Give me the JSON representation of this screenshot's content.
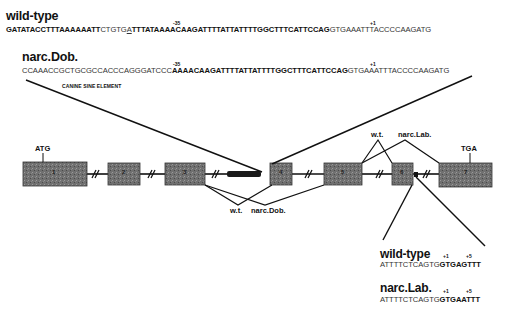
{
  "top": {
    "wildtype": {
      "title": "wild-type",
      "marker_minus": "-35",
      "marker_plus": "+1",
      "seq_parts": [
        "GATATACCTTTAAAAAATT",
        "CTGTG",
        "A",
        "TTTATAAAACAAGATTTTATTATTTTGGCTTTCATTCCAG",
        "GTGAAATTTACCCCAAGATG"
      ]
    },
    "narc_dob": {
      "title": "narc.Dob.",
      "marker_minus": "-35",
      "marker_plus": "+1",
      "seq_parts": [
        "CCAAACCGCTGCGCCACCCAGGGATCCC",
        "AAAACAAGATTTTATTATTTTGGCTTTCATTCCAG",
        "GTGAAATTTACCCCAAGATG"
      ]
    },
    "sine_label": "CANINE SINE ELEMENT"
  },
  "gene": {
    "start_codon": "ATG",
    "stop_codon": "TGA",
    "exons": [
      "1",
      "2",
      "3",
      "4",
      "5",
      "6",
      "7"
    ],
    "colors": {
      "exon_fill": "#6e6e6e",
      "sine_fill": "#1a1a1a",
      "line": "#111111"
    }
  },
  "splice_labels": {
    "dob_wt": "w.t.",
    "dob_mut": "narc.Dob.",
    "lab_wt": "w.t.",
    "lab_mut": "narc.Lab."
  },
  "bottom": {
    "wildtype": {
      "title": "wild-type",
      "marker_plus1": "+1",
      "marker_plus5": "+5",
      "seq_parts": [
        "ATTTTCTCAGTG",
        "GTGAGTTT"
      ]
    },
    "narc_lab": {
      "title": "narc.Lab.",
      "marker_plus1": "+1",
      "marker_plus5": "+5",
      "seq_parts": [
        "ATTTTCTCAGTG",
        "GTGAATTT"
      ]
    }
  }
}
